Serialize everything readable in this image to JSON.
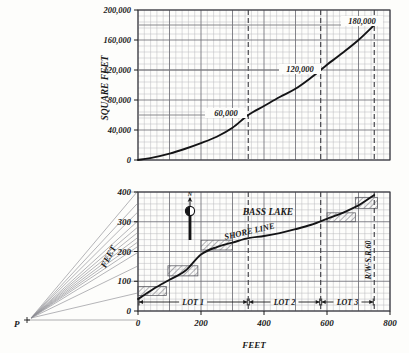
{
  "figure": {
    "kind": "engineering-survey-drawing",
    "ink_color": "#1a1a1a",
    "grid_color": "#b9b9bd",
    "grid_major_color": "#6f6f76",
    "fan_color": "#8d8d93",
    "hatch_color": "#555560"
  },
  "upper_chart": {
    "name": "cumulative-area-curve",
    "ylabel": "SQUARE FEET",
    "y_ticks": [
      "200,000",
      "160,000",
      "120,000",
      "80,000",
      "40,000",
      "0"
    ],
    "y_values": [
      200000,
      160000,
      120000,
      80000,
      40000,
      0
    ],
    "annotations": [
      {
        "label": "180,000",
        "x": 750,
        "y": 180000
      },
      {
        "label": "120,000",
        "x": 580,
        "y": 120000
      },
      {
        "label": "60,000",
        "x": 350,
        "y": 60000
      }
    ],
    "dashed_verticals": [
      350,
      580,
      750
    ]
  },
  "lower_chart": {
    "name": "shore-line-profile",
    "ylabel": "FEET",
    "xlabel": "FEET",
    "y_ticks": [
      "400",
      "300",
      "200",
      "100",
      "0"
    ],
    "y_values": [
      400,
      300,
      200,
      100,
      0
    ],
    "x_ticks": [
      "0",
      "200",
      "400",
      "600",
      "800"
    ],
    "x_values": [
      0,
      200,
      400,
      600,
      800
    ],
    "labels": {
      "lake": "BASS LAKE",
      "shore": "SHORE  LINE",
      "right_of_way": "R/W-S.R.60",
      "north": "N",
      "pole_point": "P"
    },
    "lots": [
      {
        "label": "LOT 1",
        "from": 0,
        "to": 350
      },
      {
        "label": "LOT 2",
        "from": 350,
        "to": 580
      },
      {
        "label": "LOT 3",
        "from": 580,
        "to": 750
      }
    ],
    "dashed_verticals": [
      350,
      580,
      750
    ]
  },
  "chart_data": [
    {
      "type": "line",
      "name": "cumulative-area",
      "title": "",
      "xlabel": "",
      "ylabel": "SQUARE FEET",
      "xlim": [
        0,
        800
      ],
      "ylim": [
        0,
        200000
      ],
      "grid": true,
      "x": [
        0,
        50,
        100,
        150,
        200,
        250,
        300,
        350,
        400,
        450,
        500,
        550,
        580,
        600,
        650,
        700,
        750
      ],
      "y": [
        0,
        3500,
        8500,
        15000,
        22500,
        31000,
        43000,
        60000,
        72000,
        84000,
        95000,
        110000,
        120000,
        127000,
        143000,
        160000,
        180000
      ],
      "annotations": [
        "60,000",
        "120,000",
        "180,000"
      ]
    },
    {
      "type": "line",
      "name": "shore-line",
      "title": "",
      "xlabel": "FEET",
      "ylabel": "FEET",
      "xlim": [
        0,
        800
      ],
      "ylim": [
        0,
        400
      ],
      "grid": true,
      "x": [
        0,
        50,
        100,
        150,
        200,
        250,
        300,
        350,
        400,
        450,
        500,
        550,
        600,
        650,
        700,
        750
      ],
      "y": [
        40,
        75,
        105,
        135,
        190,
        215,
        230,
        245,
        252,
        262,
        275,
        290,
        310,
        330,
        355,
        390
      ],
      "annotations": [
        "BASS LAKE",
        "SHORE  LINE",
        "R/W-S.R.60",
        "LOT 1",
        "LOT 2",
        "LOT 3"
      ]
    }
  ]
}
